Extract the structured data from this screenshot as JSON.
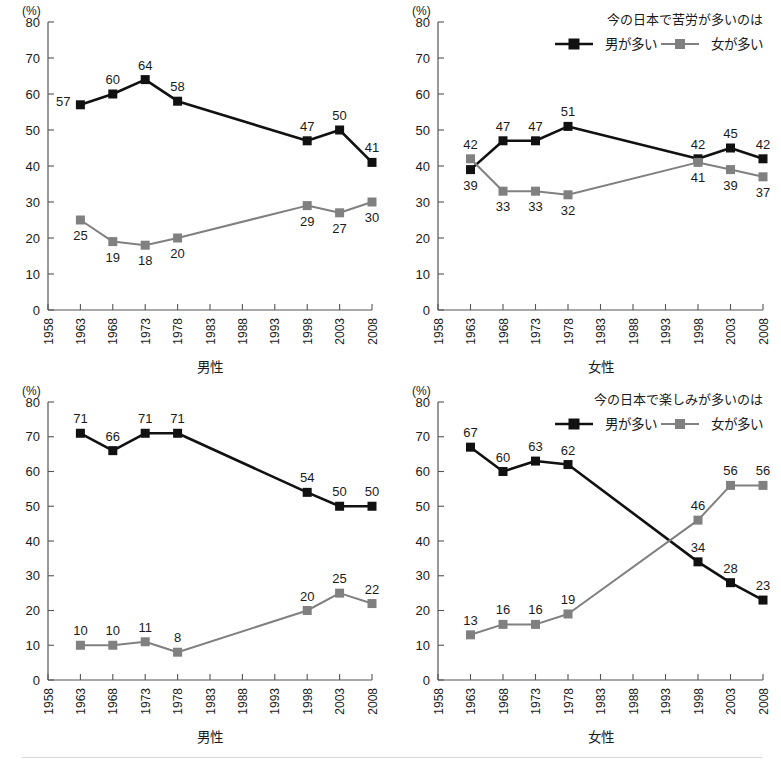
{
  "figure": {
    "percent_symbol": "(%)",
    "series_names": {
      "male": "男が多い",
      "female": "女が多い"
    },
    "colors": {
      "male": "#111111",
      "female": "#808080",
      "axis": "#555555",
      "text": "#1a1a1a"
    }
  },
  "chart_data": [
    {
      "id": "hardship-men",
      "type": "line",
      "position": "top-left",
      "title": "",
      "legend": null,
      "xlabel": "男性",
      "ylabel": "",
      "unit": "(%)",
      "ylim": [
        0,
        80
      ],
      "yticks": [
        0,
        10,
        20,
        30,
        40,
        50,
        60,
        70,
        80
      ],
      "x": [
        1958,
        1963,
        1968,
        1973,
        1978,
        1983,
        1988,
        1993,
        1998,
        2003,
        2008
      ],
      "xticklabels": [
        "1958",
        "1963",
        "1968",
        "1973",
        "1978",
        "1983",
        "1988",
        "1993",
        "1998",
        "2003",
        "2008"
      ],
      "xlim": [
        1958,
        2008
      ],
      "grid": false,
      "series": [
        {
          "name": "男が多い",
          "color": "#111111",
          "x": [
            1963,
            1968,
            1973,
            1978,
            1998,
            2003,
            2008
          ],
          "values": [
            57,
            60,
            64,
            58,
            47,
            50,
            41
          ],
          "labels": [
            "57",
            "60",
            "64",
            "58",
            "47",
            "50",
            "41"
          ],
          "label_pos": [
            "left",
            "above",
            "above",
            "above",
            "above",
            "above",
            "above"
          ]
        },
        {
          "name": "女が多い",
          "color": "#808080",
          "x": [
            1963,
            1968,
            1973,
            1978,
            1998,
            2003,
            2008
          ],
          "values": [
            25,
            19,
            18,
            20,
            29,
            27,
            30
          ],
          "labels": [
            "25",
            "19",
            "18",
            "20",
            "29",
            "27",
            "30"
          ],
          "label_pos": [
            "below",
            "below",
            "below",
            "below",
            "below",
            "below",
            "below"
          ]
        }
      ]
    },
    {
      "id": "hardship-women",
      "type": "line",
      "position": "top-right",
      "title": "",
      "legend": {
        "title": "今の日本で苦労が多いのは",
        "entries": [
          "男が多い",
          "女が多い"
        ],
        "position": "top-right"
      },
      "xlabel": "女性",
      "ylabel": "",
      "unit": "(%)",
      "ylim": [
        0,
        80
      ],
      "yticks": [
        0,
        10,
        20,
        30,
        40,
        50,
        60,
        70,
        80
      ],
      "x": [
        1958,
        1963,
        1968,
        1973,
        1978,
        1983,
        1988,
        1993,
        1998,
        2003,
        2008
      ],
      "xticklabels": [
        "1958",
        "1963",
        "1968",
        "1973",
        "1978",
        "1983",
        "1988",
        "1993",
        "1998",
        "2003",
        "2008"
      ],
      "xlim": [
        1958,
        2008
      ],
      "grid": false,
      "series": [
        {
          "name": "男が多い",
          "color": "#111111",
          "x": [
            1963,
            1968,
            1973,
            1978,
            1998,
            2003,
            2008
          ],
          "values": [
            39,
            47,
            47,
            51,
            42,
            45,
            42
          ],
          "labels": [
            "39",
            "47",
            "47",
            "51",
            "42",
            "45",
            "42"
          ],
          "label_pos": [
            "below",
            "above",
            "above",
            "above",
            "above",
            "above",
            "above"
          ]
        },
        {
          "name": "女が多い",
          "color": "#808080",
          "x": [
            1963,
            1968,
            1973,
            1978,
            1998,
            2003,
            2008
          ],
          "values": [
            42,
            33,
            33,
            32,
            41,
            39,
            37
          ],
          "labels": [
            "42",
            "33",
            "33",
            "32",
            "41",
            "39",
            "37"
          ],
          "label_pos": [
            "above",
            "below",
            "below",
            "below",
            "below",
            "below",
            "below"
          ]
        }
      ]
    },
    {
      "id": "enjoyment-men",
      "type": "line",
      "position": "bottom-left",
      "title": "",
      "legend": null,
      "xlabel": "男性",
      "ylabel": "",
      "unit": "(%)",
      "ylim": [
        0,
        80
      ],
      "yticks": [
        0,
        10,
        20,
        30,
        40,
        50,
        60,
        70,
        80
      ],
      "x": [
        1958,
        1963,
        1968,
        1973,
        1978,
        1983,
        1988,
        1993,
        1998,
        2003,
        2008
      ],
      "xticklabels": [
        "1958",
        "1963",
        "1968",
        "1973",
        "1978",
        "1983",
        "1988",
        "1993",
        "1998",
        "2003",
        "2008"
      ],
      "xlim": [
        1958,
        2008
      ],
      "grid": false,
      "series": [
        {
          "name": "男が多い",
          "color": "#111111",
          "x": [
            1963,
            1968,
            1973,
            1978,
            1998,
            2003,
            2008
          ],
          "values": [
            71,
            66,
            71,
            71,
            54,
            50,
            50
          ],
          "labels": [
            "71",
            "66",
            "71",
            "71",
            "54",
            "50",
            "50"
          ],
          "label_pos": [
            "above",
            "above",
            "above",
            "above",
            "above",
            "above",
            "above"
          ]
        },
        {
          "name": "女が多い",
          "color": "#808080",
          "x": [
            1963,
            1968,
            1973,
            1978,
            1998,
            2003,
            2008
          ],
          "values": [
            10,
            10,
            11,
            8,
            20,
            25,
            22
          ],
          "labels": [
            "10",
            "10",
            "11",
            "8",
            "20",
            "25",
            "22"
          ],
          "label_pos": [
            "above",
            "above",
            "above",
            "above",
            "above",
            "above",
            "above"
          ]
        }
      ]
    },
    {
      "id": "enjoyment-women",
      "type": "line",
      "position": "bottom-right",
      "title": "",
      "legend": {
        "title": "今の日本で楽しみが多いのは",
        "entries": [
          "男が多い",
          "女が多い"
        ],
        "position": "top-right"
      },
      "xlabel": "女性",
      "ylabel": "",
      "unit": "(%)",
      "ylim": [
        0,
        80
      ],
      "yticks": [
        0,
        10,
        20,
        30,
        40,
        50,
        60,
        70,
        80
      ],
      "x": [
        1958,
        1963,
        1968,
        1973,
        1978,
        1983,
        1988,
        1993,
        1998,
        2003,
        2008
      ],
      "xticklabels": [
        "1958",
        "1963",
        "1968",
        "1973",
        "1978",
        "1983",
        "1988",
        "1993",
        "1998",
        "2003",
        "2008"
      ],
      "xlim": [
        1958,
        2008
      ],
      "grid": false,
      "series": [
        {
          "name": "男が多い",
          "color": "#111111",
          "x": [
            1963,
            1968,
            1973,
            1978,
            1998,
            2003,
            2008
          ],
          "values": [
            67,
            60,
            63,
            62,
            34,
            28,
            23
          ],
          "labels": [
            "67",
            "60",
            "63",
            "62",
            "34",
            "28",
            "23"
          ],
          "label_pos": [
            "above",
            "above",
            "above",
            "above",
            "above",
            "above",
            "above"
          ]
        },
        {
          "name": "女が多い",
          "color": "#808080",
          "x": [
            1963,
            1968,
            1973,
            1978,
            1998,
            2003,
            2008
          ],
          "values": [
            13,
            16,
            16,
            19,
            46,
            56,
            56
          ],
          "labels": [
            "13",
            "16",
            "16",
            "19",
            "46",
            "56",
            "56"
          ],
          "label_pos": [
            "above",
            "above",
            "above",
            "above",
            "above",
            "above",
            "above"
          ]
        }
      ]
    }
  ]
}
